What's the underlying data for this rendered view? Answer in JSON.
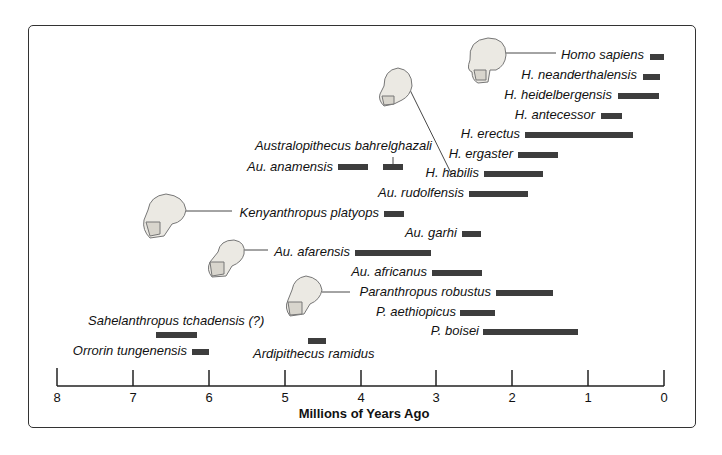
{
  "chart_data": {
    "type": "bar",
    "subtype": "range-timeline",
    "title": "",
    "xlabel": "Millions of Years Ago",
    "ylabel": "",
    "xlim": [
      8,
      0
    ],
    "x_ticks": [
      "8",
      "7",
      "6",
      "5",
      "4",
      "3",
      "2",
      "1",
      "0"
    ],
    "grid": false,
    "legend": null,
    "series": [
      {
        "name": "Homo sapiens",
        "start": 0.18,
        "end": 0.0
      },
      {
        "name": "H. neanderthalensis",
        "start": 0.28,
        "end": 0.05
      },
      {
        "name": "H. heidelbergensis",
        "start": 0.61,
        "end": 0.07
      },
      {
        "name": "H. antecessor",
        "start": 0.83,
        "end": 0.55
      },
      {
        "name": "H. erectus",
        "start": 1.83,
        "end": 0.41
      },
      {
        "name": "H. ergaster",
        "start": 1.92,
        "end": 1.4
      },
      {
        "name": "H. habilis",
        "start": 2.37,
        "end": 1.59
      },
      {
        "name": "Au. rudolfensis",
        "start": 2.57,
        "end": 1.79
      },
      {
        "name": "Australopithecus bahrelghazali",
        "start": 3.7,
        "end": 3.44
      },
      {
        "name": "Au. anamensis",
        "start": 4.3,
        "end": 3.9
      },
      {
        "name": "Kenyanthropus platyops",
        "start": 3.69,
        "end": 3.43
      },
      {
        "name": "Au. garhi",
        "start": 2.66,
        "end": 2.41
      },
      {
        "name": "Au. afarensis",
        "start": 4.07,
        "end": 3.07
      },
      {
        "name": "Au. africanus",
        "start": 3.06,
        "end": 2.4
      },
      {
        "name": "Paranthropus robustus",
        "start": 2.21,
        "end": 1.46
      },
      {
        "name": "P. aethiopicus",
        "start": 2.69,
        "end": 2.23
      },
      {
        "name": "P. boisei",
        "start": 2.38,
        "end": 1.13
      },
      {
        "name": "Sahelanthropus tchadensis (?)",
        "start": 6.69,
        "end": 6.15
      },
      {
        "name": "Orrorin tungenensis",
        "start": 6.22,
        "end": 5.99
      },
      {
        "name": "Ardipithecus ramidus",
        "start": 4.69,
        "end": 4.45
      }
    ],
    "annotations": [
      "skull illustrations linked to Homo sapiens, H. habilis, Kenyanthropus platyops, Au. afarensis, Paranthropus robustus"
    ]
  },
  "labels": {
    "homo_sapiens": "Homo sapiens",
    "neanderthalensis": "H. neanderthalensis",
    "heidelbergensis": "H. heidelbergensis",
    "antecessor": "H. antecessor",
    "erectus": "H. erectus",
    "ergaster": "H. ergaster",
    "habilis": "H. habilis",
    "rudolfensis": "Au. rudolfensis",
    "bahrelghazali": "Australopithecus bahrelghazali",
    "anamensis": "Au. anamensis",
    "platyops": "Kenyanthropus platyops",
    "garhi": "Au. garhi",
    "afarensis": "Au. afarensis",
    "africanus": "Au. africanus",
    "robustus": "Paranthropus robustus",
    "aethiopicus": "P. aethiopicus",
    "boisei": "P. boisei",
    "sahelanthropus": "Sahelanthropus tchadensis (?)",
    "orrorin": "Orrorin tungenensis",
    "ardipithecus": "Ardipithecus ramidus"
  },
  "axis": {
    "ticks": [
      "8",
      "7",
      "6",
      "5",
      "4",
      "3",
      "2",
      "1",
      "0"
    ],
    "title": "Millions of Years Ago"
  },
  "colors": {
    "bar": "#3d3d3d",
    "frame": "#333333",
    "skull": "#e8e6e0"
  }
}
